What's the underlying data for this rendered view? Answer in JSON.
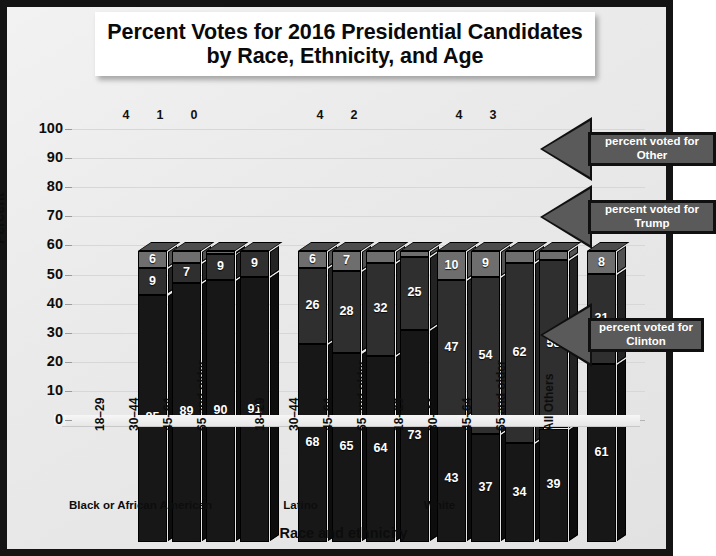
{
  "title": "Percent Votes for 2016 Presidential Candidates by Race, Ethnicity, and Age",
  "axis": {
    "ylabel": "Percent",
    "xlabel": "Race and ethnicity",
    "yticks": [
      "100",
      "90",
      "80",
      "70",
      "60",
      "50",
      "40",
      "30",
      "20",
      "10",
      "0"
    ]
  },
  "callouts": [
    {
      "name": "other",
      "text": "percent voted for Other"
    },
    {
      "name": "trump",
      "text": "percent voted for Trump"
    },
    {
      "name": "clinton",
      "text": "percent voted for Clinton"
    }
  ],
  "chart_data": {
    "type": "bar",
    "subtype": "stacked-3d",
    "title": "Percent Votes for 2016 Presidential Candidates by Race, Ethnicity, and Age",
    "xlabel": "Race and ethnicity",
    "ylabel": "Percent",
    "ylim": [
      0,
      100
    ],
    "yticks": [
      0,
      10,
      20,
      30,
      40,
      50,
      60,
      70,
      80,
      90,
      100
    ],
    "grid": true,
    "legend": "annotated-callouts",
    "series": [
      {
        "name": "percent voted for Clinton",
        "color": "#171717"
      },
      {
        "name": "percent voted for Trump",
        "color": "#2f2f2f"
      },
      {
        "name": "percent voted for Other",
        "color": "#6e6e6e"
      }
    ],
    "groups": [
      {
        "label": "Black or African American",
        "bars": [
          {
            "category": "18–29",
            "clinton": 85,
            "trump": 9,
            "other": 6,
            "other_label_above": false
          },
          {
            "category": "30–44",
            "clinton": 89,
            "trump": 7,
            "other": 4,
            "other_label_above": true
          },
          {
            "category": "45–64",
            "clinton": 90,
            "trump": 9,
            "other": 1,
            "other_label_above": true
          },
          {
            "category": "65 and older",
            "clinton": 91,
            "trump": 9,
            "other": 0,
            "other_label_above": true
          }
        ]
      },
      {
        "label": "Latino",
        "bars": [
          {
            "category": "18–29",
            "clinton": 68,
            "trump": 26,
            "other": 6,
            "other_label_above": false
          },
          {
            "category": "30–44",
            "clinton": 65,
            "trump": 28,
            "other": 7,
            "other_label_above": false
          },
          {
            "category": "45–64",
            "clinton": 64,
            "trump": 32,
            "other": 4,
            "other_label_above": true
          },
          {
            "category": "65 and older",
            "clinton": 73,
            "trump": 25,
            "other": 2,
            "other_label_above": true
          }
        ]
      },
      {
        "label": "White",
        "bars": [
          {
            "category": "18–29",
            "clinton": 43,
            "trump": 47,
            "other": 10,
            "other_label_above": false
          },
          {
            "category": "30–44",
            "clinton": 37,
            "trump": 54,
            "other": 9,
            "other_label_above": false
          },
          {
            "category": "45–64",
            "clinton": 34,
            "trump": 62,
            "other": 4,
            "other_label_above": true
          },
          {
            "category": "65 and older",
            "clinton": 39,
            "trump": 58,
            "other": 3,
            "other_label_above": true
          }
        ]
      },
      {
        "label": "",
        "bars": [
          {
            "category": "All Others",
            "clinton": 61,
            "trump": 31,
            "other": 8,
            "other_label_above": false
          }
        ]
      }
    ]
  }
}
